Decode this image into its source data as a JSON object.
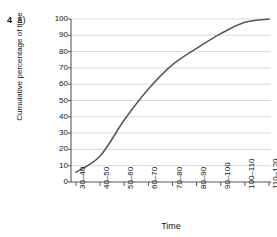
{
  "figure": {
    "question_number": "4",
    "question_part": "a)"
  },
  "chart_data": {
    "type": "line",
    "title": "",
    "subtitle": "",
    "xlabel": "Time",
    "ylabel": "Cumulative percentage of time",
    "categories": [
      "30–40",
      "40–50",
      "50–60",
      "60–70",
      "70–80",
      "80–90",
      "90–100",
      "100–110",
      "110–120"
    ],
    "values": [
      6,
      16,
      38,
      57,
      72,
      82,
      91,
      98,
      100
    ],
    "ylim": [
      0,
      100
    ],
    "ytick_values": [
      0,
      10,
      20,
      30,
      40,
      50,
      60,
      70,
      80,
      90,
      100
    ],
    "ytick_labels": [
      "0",
      "10",
      "20",
      "30",
      "40",
      "50",
      "60",
      "70",
      "80",
      "90",
      "100"
    ],
    "grid": "horizontal",
    "grid_color": "#d9d9d9",
    "line_color": "#555555",
    "legend": "none",
    "axis_color": "#555555",
    "background": "#ffffff"
  }
}
